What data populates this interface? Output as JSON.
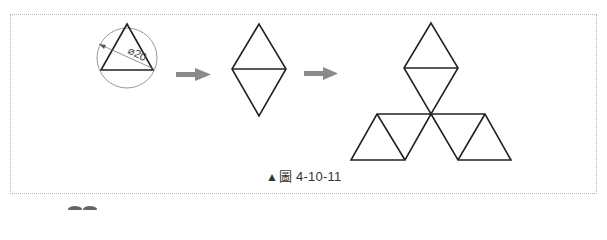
{
  "figure": {
    "caption_marker": "▲",
    "caption_text": "圖 4-10-11",
    "dimension_label": "⌀20",
    "steps": [
      {
        "name": "circle-with-inscribed-triangle",
        "note": "equilateral triangle inscribed in circle of diameter 20"
      },
      {
        "name": "two-triangles-rhombus",
        "note": "triangle mirrored to form a rhombus"
      },
      {
        "name": "three-rhombus-emblem",
        "note": "three rhombuses arranged around a common vertex"
      }
    ],
    "colors": {
      "line": "#222222",
      "circle": "#9a9a9a",
      "arrow": "#8a8a8a",
      "frame": "#b8b8b8"
    }
  }
}
